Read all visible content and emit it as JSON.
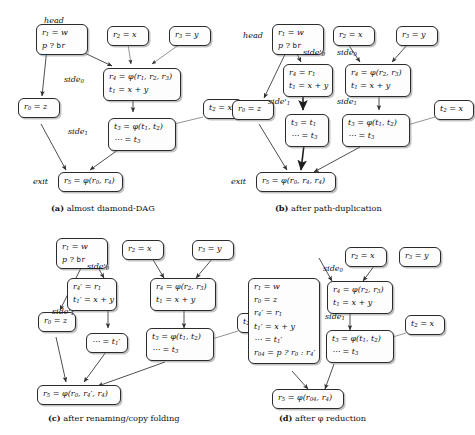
{
  "figure": {
    "title_present": false,
    "panels": [
      {
        "id": "a",
        "caption_tag": "(a)",
        "caption_text": "almost diamond-DAG",
        "labels": [
          {
            "name": "head",
            "text": "head"
          },
          {
            "name": "side0",
            "text": "side",
            "sub": "0"
          },
          {
            "name": "side1",
            "text": "side",
            "sub": "1"
          },
          {
            "name": "exit",
            "text": "exit"
          }
        ],
        "nodes": [
          {
            "name": "head-node",
            "lines": [
              "r1 = w",
              "p ? br"
            ]
          },
          {
            "name": "r2-node",
            "lines": [
              "r2 = x"
            ]
          },
          {
            "name": "r3-node",
            "lines": [
              "r3 = y"
            ]
          },
          {
            "name": "side0-node",
            "lines": [
              "r4 = φ(r1, r2, r3)",
              "t1 = x + y"
            ]
          },
          {
            "name": "r0-node",
            "lines": [
              "r0 = z"
            ]
          },
          {
            "name": "t2-node",
            "lines": [
              "t2 = x"
            ]
          },
          {
            "name": "side1-node",
            "lines": [
              "t3 = φ(t1, t2)",
              "⋯ = t3"
            ]
          },
          {
            "name": "exit-node",
            "lines": [
              "r5 = φ(r0, r4)"
            ]
          }
        ]
      },
      {
        "id": "b",
        "caption_tag": "(b)",
        "caption_text": "after path-duplication",
        "labels": [
          {
            "name": "head",
            "text": "head"
          },
          {
            "name": "side0-prime",
            "text": "side'",
            "sub": "0"
          },
          {
            "name": "side0",
            "text": "side",
            "sub": "0"
          },
          {
            "name": "side1-prime",
            "text": "side'",
            "sub": "1"
          },
          {
            "name": "side1",
            "text": "side",
            "sub": "1"
          },
          {
            "name": "exit",
            "text": "exit"
          }
        ],
        "nodes": [
          {
            "name": "head-node",
            "lines": [
              "r1 = w",
              "p ? br"
            ]
          },
          {
            "name": "r2-node",
            "lines": [
              "r2 = x"
            ]
          },
          {
            "name": "r3-node",
            "lines": [
              "r3 = y"
            ]
          },
          {
            "name": "side0-prime-node",
            "lines": [
              "r4 = r1",
              "t1 = x + y"
            ]
          },
          {
            "name": "side0-node",
            "lines": [
              "r4 = φ(r2, r3)",
              "t1 = x + y"
            ]
          },
          {
            "name": "r0-node",
            "lines": [
              "r0 = z"
            ]
          },
          {
            "name": "t2-node",
            "lines": [
              "t2 = x"
            ]
          },
          {
            "name": "side1-prime-node",
            "lines": [
              "t3 = t1",
              "⋯ = t3"
            ]
          },
          {
            "name": "side1-node",
            "lines": [
              "t3 = φ(t1, t2)",
              "⋯ = t3"
            ]
          },
          {
            "name": "exit-node",
            "lines": [
              "r5 = φ(r0, r4, r4)"
            ]
          }
        ]
      },
      {
        "id": "c",
        "caption_tag": "(c)",
        "caption_text": "after renaming/copy folding",
        "labels": [
          {
            "name": "side0-prime",
            "text": "side'",
            "sub": "0"
          },
          {
            "name": "side1-prime",
            "text": "side'",
            "sub": "1"
          }
        ],
        "nodes": [
          {
            "name": "head-node",
            "lines": [
              "r1 = w",
              "p ? br"
            ]
          },
          {
            "name": "r2-node",
            "lines": [
              "r2 = x"
            ]
          },
          {
            "name": "r3-node",
            "lines": [
              "r3 = y"
            ]
          },
          {
            "name": "side0-prime-node",
            "lines": [
              "r4' = r1",
              "t1' = x + y"
            ]
          },
          {
            "name": "side0-node",
            "lines": [
              "r4 = φ(r2, r3)",
              "t1 = x + y"
            ]
          },
          {
            "name": "r0-node",
            "lines": [
              "r0 = z"
            ]
          },
          {
            "name": "t2-node",
            "lines": [
              "t2 = x"
            ]
          },
          {
            "name": "side1-prime-node",
            "lines": [
              "⋯ = t1'"
            ]
          },
          {
            "name": "side1-node",
            "lines": [
              "t3 = φ(t1, t2)",
              "⋯ = t3"
            ]
          },
          {
            "name": "exit-node",
            "lines": [
              "r5 = φ(r0, r4', r4)"
            ]
          }
        ]
      },
      {
        "id": "d",
        "caption_tag": "(d)",
        "caption_text": "after φ reduction",
        "labels": [
          {
            "name": "side0",
            "text": "side",
            "sub": "0"
          },
          {
            "name": "side1",
            "text": "side",
            "sub": "1"
          }
        ],
        "nodes": [
          {
            "name": "merged-node",
            "lines": [
              "r1 = w",
              "r0 = z",
              "r4' = r1",
              "t1' = x + y",
              "⋯ = t1'",
              "r04 = p ? r0 : r4'"
            ]
          },
          {
            "name": "r2-node",
            "lines": [
              "r2 = x"
            ]
          },
          {
            "name": "r3-node",
            "lines": [
              "r3 = y"
            ]
          },
          {
            "name": "side0-node",
            "lines": [
              "r4 = φ(r2, r3)",
              "t1 = x + y"
            ]
          },
          {
            "name": "t2-node",
            "lines": [
              "t2 = x"
            ]
          },
          {
            "name": "side1-node",
            "lines": [
              "t3 = φ(t1, t2)",
              "⋯ = t3"
            ]
          },
          {
            "name": "exit-node",
            "lines": [
              "r5 = φ(r04, r4)"
            ]
          }
        ]
      }
    ],
    "colors": {
      "node_border": "#2b2b2b",
      "node_fill": "#fdfdfd",
      "edge": "#3a3a3a",
      "text": "#111111",
      "background": "#ffffff"
    }
  }
}
